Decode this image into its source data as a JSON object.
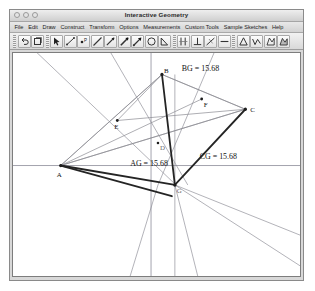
{
  "window": {
    "title": "Interactive Geometry",
    "controls": [
      {
        "name": "close",
        "label": "close"
      },
      {
        "name": "minimize",
        "label": "minimize"
      },
      {
        "name": "zoom",
        "label": "zoom"
      }
    ]
  },
  "menubar": {
    "items": [
      {
        "id": "file",
        "label": "File"
      },
      {
        "id": "edit",
        "label": "Edit"
      },
      {
        "id": "draw",
        "label": "Draw"
      },
      {
        "id": "construct",
        "label": "Construct"
      },
      {
        "id": "transform",
        "label": "Transform"
      },
      {
        "id": "options",
        "label": "Options"
      },
      {
        "id": "measurements",
        "label": "Measurements"
      },
      {
        "id": "custom-tools",
        "label": "Custom Tools"
      },
      {
        "id": "sample-sketches",
        "label": "Sample Sketches"
      },
      {
        "id": "help",
        "label": "Help"
      }
    ]
  },
  "toolbar": {
    "groups": [
      {
        "id": "history",
        "buttons": [
          {
            "id": "undo",
            "icon": "undo-icon",
            "tip": "Undo"
          },
          {
            "id": "redo",
            "icon": "redo-icon",
            "tip": "Redo"
          }
        ]
      },
      {
        "id": "draw",
        "buttons": [
          {
            "id": "select",
            "icon": "arrow-select-icon",
            "tip": "Select"
          },
          {
            "id": "segment",
            "icon": "segment-icon",
            "tip": "Segment"
          },
          {
            "id": "point",
            "icon": "point-icon",
            "tip": "Point"
          },
          {
            "id": "line",
            "icon": "line-icon",
            "tip": "Line"
          },
          {
            "id": "ray",
            "icon": "ray-icon",
            "tip": "Ray"
          },
          {
            "id": "vector",
            "icon": "vector-icon",
            "tip": "Vector"
          },
          {
            "id": "arrow",
            "icon": "arrow-icon",
            "tip": "Arrow"
          },
          {
            "id": "circle",
            "icon": "circle-icon",
            "tip": "Circle"
          },
          {
            "id": "angle",
            "icon": "angle-icon",
            "tip": "Angle"
          }
        ]
      },
      {
        "id": "construct",
        "buttons": [
          {
            "id": "parallel",
            "icon": "parallel-lines-icon",
            "tip": "Parallel"
          },
          {
            "id": "perpendicular",
            "icon": "perpendicular-icon",
            "tip": "Perpendicular"
          },
          {
            "id": "midpoint",
            "icon": "midpoint-icon",
            "tip": "Midpoint"
          },
          {
            "id": "measure-length",
            "icon": "length-icon",
            "tip": "Length"
          }
        ]
      },
      {
        "id": "polygons",
        "buttons": [
          {
            "id": "triangle",
            "icon": "triangle-icon",
            "tip": "Triangle"
          },
          {
            "id": "polyline",
            "icon": "polyline-icon",
            "tip": "Polyline"
          },
          {
            "id": "polygon",
            "icon": "polygon-icon",
            "tip": "Polygon"
          },
          {
            "id": "region",
            "icon": "region-icon",
            "tip": "Region"
          }
        ]
      }
    ]
  },
  "sketch": {
    "axes": {
      "x_axis": true,
      "y_axis": true,
      "grid": "dots"
    },
    "points": [
      {
        "id": "A",
        "label": "A",
        "x": 62,
        "y": 163,
        "label_dx": -2,
        "label_dy": 12
      },
      {
        "id": "B",
        "label": "B",
        "x": 163,
        "y": 74,
        "label_dx": 3,
        "label_dy": 2
      },
      {
        "id": "C",
        "label": "C",
        "x": 247,
        "y": 108,
        "label_dx": 5,
        "label_dy": 3
      },
      {
        "id": "E",
        "label": "E",
        "x": 119,
        "y": 126,
        "label_dx": -1,
        "label_dy": 9
      },
      {
        "id": "F",
        "label": "F",
        "x": 204,
        "y": 98,
        "label_dx": 2,
        "label_dy": 9
      },
      {
        "id": "D",
        "label": "D",
        "x": 159,
        "y": 141,
        "label_dx": 2,
        "label_dy": 7
      },
      {
        "id": "G",
        "label": "G",
        "x": 176,
        "y": 182,
        "label_dx": 2,
        "label_dy": 8
      }
    ],
    "measurements": [
      {
        "id": "bg",
        "label": "BG = 15.68",
        "x": 184,
        "y": 72
      },
      {
        "id": "ag",
        "label": "AG = 15.68",
        "x": 135,
        "y": 160
      },
      {
        "id": "cg",
        "label": "CG = 15.68",
        "x": 200,
        "y": 156
      }
    ],
    "colors": {
      "stroke_heavy": "#2b2b2b",
      "stroke_light": "#7a7a7a",
      "axis": "#9a9aa6",
      "dot": "#c9c9d4",
      "canvas_bg": "#ffffff"
    }
  }
}
